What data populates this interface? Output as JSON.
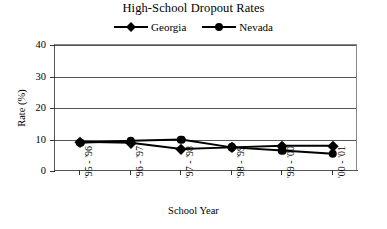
{
  "chart_data": {
    "type": "line",
    "title": "High-School Dropout Rates",
    "xlabel": "School Year",
    "ylabel": "Rate (%)",
    "categories": [
      "'95 - '96",
      "'96 - '97",
      "'97 - '98",
      "'98 - '99",
      "'99 - '00",
      "'00 - '01"
    ],
    "yticks": [
      0,
      10,
      20,
      30,
      40
    ],
    "ylim": [
      0,
      40
    ],
    "grid": true,
    "legend_position": "top-center",
    "series": [
      {
        "name": "Georgia",
        "marker": "diamond",
        "color": "#000000",
        "values": [
          9.3,
          9.0,
          7.0,
          7.5,
          8.0,
          8.0
        ]
      },
      {
        "name": "Nevada",
        "marker": "circle",
        "color": "#000000",
        "values": [
          9.0,
          9.6,
          10.0,
          7.5,
          6.5,
          5.5
        ]
      }
    ]
  },
  "icons": {
    "georgia_marker": "diamond-marker-icon",
    "nevada_marker": "circle-marker-icon"
  }
}
